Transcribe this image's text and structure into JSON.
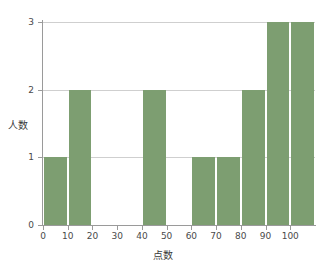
{
  "chart_data": {
    "type": "bar",
    "title": "",
    "xlabel": "点数",
    "ylabel": "人数",
    "xlim": [
      0,
      110
    ],
    "ylim": [
      0,
      3
    ],
    "grid": true,
    "legend": null,
    "bar_color": "#7d9e71",
    "bin_width": 10,
    "categories": [
      "0-10",
      "10-20",
      "20-30",
      "30-40",
      "40-50",
      "50-60",
      "60-70",
      "70-80",
      "80-90",
      "90-100",
      "100-110"
    ],
    "bin_starts": [
      0,
      10,
      20,
      30,
      40,
      50,
      60,
      70,
      80,
      90,
      100
    ],
    "values": [
      1,
      2,
      0,
      0,
      2,
      0,
      1,
      1,
      2,
      3,
      3
    ],
    "xticks": [
      0,
      10,
      20,
      30,
      40,
      50,
      60,
      70,
      80,
      90,
      100
    ],
    "xtick_labels": [
      "0",
      "10",
      "20",
      "30",
      "40",
      "50",
      "60",
      "70",
      "80",
      "90",
      "100"
    ],
    "yticks": [
      0,
      1,
      2,
      3
    ],
    "ytick_labels": [
      "0",
      "1",
      "2",
      "3"
    ]
  }
}
